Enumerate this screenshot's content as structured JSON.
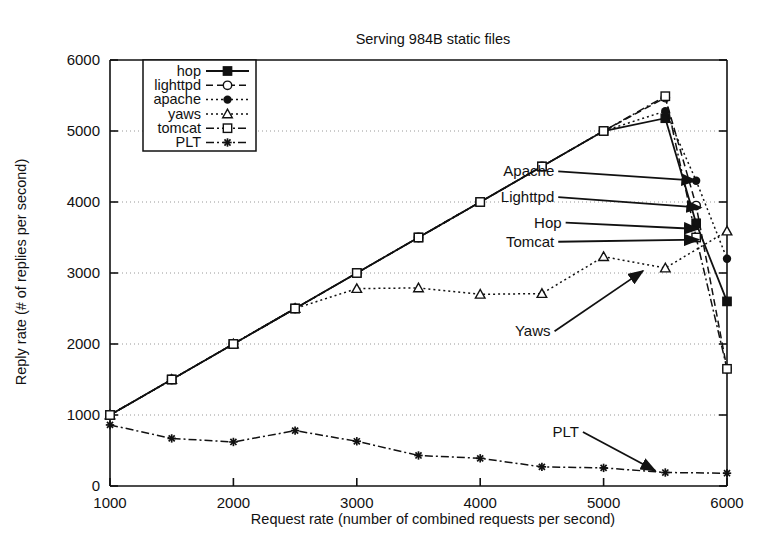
{
  "chart_data": {
    "type": "line",
    "title": "Serving 984B static files",
    "xlabel": "Request rate (number of combined requests per second)",
    "ylabel": "Reply rate (# of replies per second)",
    "xlim": [
      1000,
      6000
    ],
    "ylim": [
      0,
      6000
    ],
    "xticks": [
      1000,
      2000,
      3000,
      4000,
      5000,
      6000
    ],
    "yticks": [
      0,
      1000,
      2000,
      3000,
      4000,
      5000,
      6000
    ],
    "grid": true,
    "legend_position": "upper-left-inside",
    "series": [
      {
        "name": "hop",
        "marker": "filled-square",
        "line": "solid",
        "x": [
          1000,
          1500,
          2000,
          2500,
          3000,
          3500,
          4000,
          4500,
          5000,
          5500,
          5750,
          6000
        ],
        "y": [
          1000,
          1500,
          2000,
          2500,
          3000,
          3500,
          4000,
          4500,
          5000,
          5180,
          3700,
          2600
        ]
      },
      {
        "name": "lighttpd",
        "marker": "open-circle",
        "line": "dashed",
        "x": [
          1000,
          1500,
          2000,
          2500,
          3000,
          3500,
          4000,
          4500,
          5000,
          5500,
          5750,
          6000
        ],
        "y": [
          1000,
          1500,
          2000,
          2500,
          3000,
          3500,
          4000,
          4500,
          5000,
          5470,
          3950,
          1650
        ]
      },
      {
        "name": "apache",
        "marker": "filled-circle",
        "line": "dotted",
        "x": [
          1000,
          1500,
          2000,
          2500,
          3000,
          3500,
          4000,
          4500,
          5000,
          5500,
          5750,
          6000
        ],
        "y": [
          1000,
          1500,
          2000,
          2500,
          3000,
          3500,
          4000,
          4500,
          5000,
          5280,
          4300,
          3200
        ]
      },
      {
        "name": "yaws",
        "marker": "open-triangle",
        "line": "dotted",
        "x": [
          1000,
          1500,
          2000,
          2500,
          3000,
          3500,
          4000,
          4500,
          5000,
          5500,
          6000
        ],
        "y": [
          1000,
          1500,
          2000,
          2500,
          2780,
          2790,
          2700,
          2710,
          3230,
          3070,
          3590
        ]
      },
      {
        "name": "tomcat",
        "marker": "open-square",
        "line": "dash-dot",
        "x": [
          1000,
          1500,
          2000,
          2500,
          3000,
          3500,
          4000,
          4500,
          5000,
          5500,
          5750,
          6000
        ],
        "y": [
          1000,
          1500,
          2000,
          2500,
          3000,
          3500,
          4000,
          4500,
          5000,
          5490,
          3500,
          1650
        ]
      },
      {
        "name": "PLT",
        "marker": "star",
        "line": "dash-dot",
        "x": [
          1000,
          1500,
          2000,
          2500,
          3000,
          3500,
          4000,
          4500,
          5000,
          5500,
          6000
        ],
        "y": [
          860,
          670,
          620,
          780,
          630,
          430,
          390,
          270,
          255,
          190,
          180
        ]
      }
    ],
    "annotations": [
      {
        "text": "Apache",
        "label_x": 4600,
        "label_y": 4430,
        "target_x": 5750,
        "target_y": 4300
      },
      {
        "text": "Lighttpd",
        "label_x": 4600,
        "label_y": 4070,
        "target_x": 5790,
        "target_y": 3920
      },
      {
        "text": "Hop",
        "label_x": 4660,
        "label_y": 3710,
        "target_x": 5770,
        "target_y": 3620
      },
      {
        "text": "Tomcat",
        "label_x": 4600,
        "label_y": 3440,
        "target_x": 5770,
        "target_y": 3470
      },
      {
        "text": "Yaws",
        "label_x": 4570,
        "label_y": 2180,
        "target_x": 5320,
        "target_y": 3030
      },
      {
        "text": "PLT",
        "label_x": 4800,
        "label_y": 760,
        "target_x": 5420,
        "target_y": 215
      }
    ]
  },
  "legend": {
    "items": [
      {
        "label": "hop"
      },
      {
        "label": "lighttpd"
      },
      {
        "label": "apache"
      },
      {
        "label": "yaws"
      },
      {
        "label": "tomcat"
      },
      {
        "label": "PLT"
      }
    ]
  },
  "colors": {
    "foreground": "#111111",
    "grid": "#8d8d8d",
    "background": "#ffffff"
  }
}
